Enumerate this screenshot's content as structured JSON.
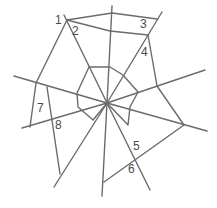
{
  "diagram": {
    "type": "spider-web",
    "line_color": "#6b6b6b",
    "center": [
      107,
      103
    ],
    "spokes": [
      [
        112,
        6
      ],
      [
        64,
        15
      ],
      [
        162,
        12
      ],
      [
        205,
        70
      ],
      [
        207,
        131
      ],
      [
        150,
        190
      ],
      [
        102,
        196
      ],
      [
        54,
        187
      ],
      [
        22,
        128
      ],
      [
        14,
        76
      ]
    ],
    "outer_paths": [
      [
        [
          67,
          20
        ],
        [
          112,
          13
        ],
        [
          157,
          19
        ]
      ],
      [
        [
          67,
          20
        ],
        [
          110,
          31
        ],
        [
          148,
          35
        ]
      ],
      [
        [
          148,
          35
        ],
        [
          157,
          86
        ],
        [
          184,
          125
        ],
        [
          104,
          182
        ]
      ],
      [
        [
          67,
          20
        ],
        [
          36,
          83
        ],
        [
          30,
          127
        ]
      ],
      [
        [
          47,
          87
        ],
        [
          60,
          174
        ]
      ]
    ],
    "inner_polygon": [
      [
        89,
        67
      ],
      [
        110,
        67
      ],
      [
        123,
        75
      ],
      [
        138,
        92
      ],
      [
        130,
        107
      ],
      [
        128,
        125
      ],
      [
        107,
        103
      ],
      [
        93,
        120
      ],
      [
        78,
        107
      ],
      [
        77,
        93
      ],
      [
        89,
        67
      ]
    ],
    "labels": [
      {
        "text": "1",
        "x": 55,
        "y": 14
      },
      {
        "text": "2",
        "x": 72,
        "y": 25
      },
      {
        "text": "3",
        "x": 140,
        "y": 18
      },
      {
        "text": "4",
        "x": 141,
        "y": 46
      },
      {
        "text": "5",
        "x": 133,
        "y": 140
      },
      {
        "text": "6",
        "x": 128,
        "y": 163
      },
      {
        "text": "7",
        "x": 37,
        "y": 102
      },
      {
        "text": "8",
        "x": 55,
        "y": 119
      }
    ]
  }
}
